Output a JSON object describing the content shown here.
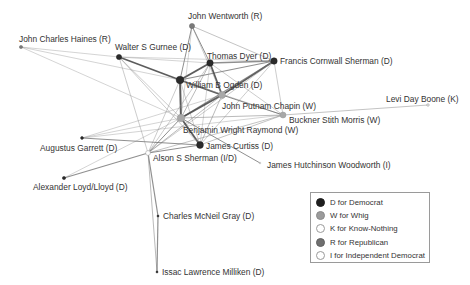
{
  "colors": {
    "D": "#2b2b2b",
    "W": "#a8a8a8",
    "K": "#ffffff",
    "R": "#7a7a7a",
    "I": "#ffffff"
  },
  "legend": {
    "items": [
      {
        "key": "D",
        "label": "D for Democrat",
        "fill": "#1e1e1e",
        "stroke": "#1e1e1e"
      },
      {
        "key": "W",
        "label": "W for Whig",
        "fill": "#9b9b9b",
        "stroke": "#8a8a8a"
      },
      {
        "key": "K",
        "label": "K for Know-Nothing",
        "fill": "#ffffff",
        "stroke": "#9a9a9a"
      },
      {
        "key": "R",
        "label": "R for Republican",
        "fill": "#6f6f6f",
        "stroke": "#606060"
      },
      {
        "key": "I",
        "label": "I for Independent Democrat",
        "fill": "#ffffff",
        "stroke": "#9a9a9a"
      }
    ]
  },
  "nodes": [
    {
      "id": "wentworth",
      "label": "John Wentworth (R)",
      "party": "R",
      "x": 192,
      "y": 26,
      "r": 2.6,
      "lx": 188,
      "ly": 19,
      "anchor": "start"
    },
    {
      "id": "haines",
      "label": "John Charles Haines (R)",
      "party": "R",
      "x": 21,
      "y": 47,
      "r": 1.6,
      "lx": 19,
      "ly": 42,
      "anchor": "start"
    },
    {
      "id": "gurnee",
      "label": "Walter S Gurnee (D)",
      "party": "D",
      "x": 119,
      "y": 57,
      "r": 2.6,
      "lx": 115,
      "ly": 50,
      "anchor": "start"
    },
    {
      "id": "dyer",
      "label": "Thomas Dyer (D)",
      "party": "D",
      "x": 210,
      "y": 63,
      "r": 3.2,
      "lx": 207,
      "ly": 59,
      "anchor": "start"
    },
    {
      "id": "fsherman",
      "label": "Francis Cornwall Sherman (D)",
      "party": "D",
      "x": 274,
      "y": 61,
      "r": 3.2,
      "lx": 280,
      "ly": 64,
      "anchor": "start"
    },
    {
      "id": "ogden",
      "label": "William B Ogden (D)",
      "party": "D",
      "x": 180,
      "y": 80,
      "r": 3.8,
      "lx": 186,
      "ly": 88,
      "anchor": "start"
    },
    {
      "id": "chapin",
      "label": "John Putnam Chapin (W)",
      "party": "W",
      "x": 222,
      "y": 95,
      "r": 3.4,
      "lx": 222,
      "ly": 109,
      "anchor": "start"
    },
    {
      "id": "boone",
      "label": "Levi Day Boone (K)",
      "party": "K",
      "x": 428,
      "y": 105,
      "r": 1.2,
      "lx": 386,
      "ly": 102,
      "anchor": "start"
    },
    {
      "id": "morris",
      "label": "Buckner Stith Morris (W)",
      "party": "W",
      "x": 283,
      "y": 115,
      "r": 3.0,
      "lx": 289,
      "ly": 123,
      "anchor": "start"
    },
    {
      "id": "raymond",
      "label": "Benjamin Wright Raymond (W)",
      "party": "W",
      "x": 181,
      "y": 118,
      "r": 3.8,
      "lx": 183,
      "ly": 133,
      "anchor": "start"
    },
    {
      "id": "garrett",
      "label": "Augustus Garrett (D)",
      "party": "D",
      "x": 82,
      "y": 138,
      "r": 1.4,
      "lx": 40,
      "ly": 151,
      "anchor": "start"
    },
    {
      "id": "curtiss",
      "label": "James Curtiss (D)",
      "party": "D",
      "x": 200,
      "y": 145,
      "r": 3.4,
      "lx": 206,
      "ly": 149,
      "anchor": "start"
    },
    {
      "id": "asherman",
      "label": "Alson S Sherman (I/D)",
      "party": "I",
      "x": 148,
      "y": 153,
      "r": 2.4,
      "lx": 153,
      "ly": 161,
      "anchor": "start"
    },
    {
      "id": "woodworth",
      "label": "James Hutchinson Woodworth (I)",
      "party": "I",
      "x": 260,
      "y": 163,
      "r": 0.8,
      "lx": 267,
      "ly": 168,
      "anchor": "start"
    },
    {
      "id": "lloyd",
      "label": "Alexander Loyd/Lloyd (D)",
      "party": "D",
      "x": 64,
      "y": 178,
      "r": 1.6,
      "lx": 33,
      "ly": 190,
      "anchor": "start"
    },
    {
      "id": "gray",
      "label": "Charles McNeil Gray (D)",
      "party": "D",
      "x": 158,
      "y": 216,
      "r": 1.0,
      "lx": 163,
      "ly": 219,
      "anchor": "start"
    },
    {
      "id": "milliken",
      "label": "Issac Lawrence Milliken (D)",
      "party": "D",
      "x": 157,
      "y": 272,
      "r": 1.0,
      "lx": 162,
      "ly": 275,
      "anchor": "start"
    }
  ],
  "edges": [
    {
      "s": "ogden",
      "t": "dyer",
      "w": 2.0
    },
    {
      "s": "ogden",
      "t": "raymond",
      "w": 2.0
    },
    {
      "s": "ogden",
      "t": "chapin",
      "w": 1.8
    },
    {
      "s": "ogden",
      "t": "fsherman",
      "w": 1.2
    },
    {
      "s": "ogden",
      "t": "gurnee",
      "w": 1.6
    },
    {
      "s": "ogden",
      "t": "wentworth",
      "w": 1.0
    },
    {
      "s": "ogden",
      "t": "morris",
      "w": 0.6
    },
    {
      "s": "ogden",
      "t": "curtiss",
      "w": 0.6
    },
    {
      "s": "ogden",
      "t": "asherman",
      "w": 0.6
    },
    {
      "s": "ogden",
      "t": "haines",
      "w": 0.5
    },
    {
      "s": "dyer",
      "t": "chapin",
      "w": 1.8
    },
    {
      "s": "dyer",
      "t": "fsherman",
      "w": 1.4
    },
    {
      "s": "dyer",
      "t": "wentworth",
      "w": 1.0
    },
    {
      "s": "dyer",
      "t": "raymond",
      "w": 0.8
    },
    {
      "s": "dyer",
      "t": "morris",
      "w": 0.6
    },
    {
      "s": "dyer",
      "t": "asherman",
      "w": 0.6
    },
    {
      "s": "dyer",
      "t": "curtiss",
      "w": 0.5
    },
    {
      "s": "dyer",
      "t": "gurnee",
      "w": 0.5
    },
    {
      "s": "wentworth",
      "t": "fsherman",
      "w": 0.7
    },
    {
      "s": "wentworth",
      "t": "chapin",
      "w": 0.6
    },
    {
      "s": "wentworth",
      "t": "raymond",
      "w": 0.5
    },
    {
      "s": "fsherman",
      "t": "chapin",
      "w": 1.6
    },
    {
      "s": "fsherman",
      "t": "raymond",
      "w": 1.2
    },
    {
      "s": "fsherman",
      "t": "morris",
      "w": 0.6
    },
    {
      "s": "fsherman",
      "t": "curtiss",
      "w": 0.6
    },
    {
      "s": "fsherman",
      "t": "asherman",
      "w": 0.6
    },
    {
      "s": "fsherman",
      "t": "gurnee",
      "w": 0.5
    },
    {
      "s": "chapin",
      "t": "raymond",
      "w": 1.8
    },
    {
      "s": "chapin",
      "t": "morris",
      "w": 1.0
    },
    {
      "s": "chapin",
      "t": "curtiss",
      "w": 0.8
    },
    {
      "s": "chapin",
      "t": "asherman",
      "w": 0.8
    },
    {
      "s": "chapin",
      "t": "garrett",
      "w": 0.5
    },
    {
      "s": "raymond",
      "t": "curtiss",
      "w": 1.8
    },
    {
      "s": "raymond",
      "t": "morris",
      "w": 0.8
    },
    {
      "s": "raymond",
      "t": "asherman",
      "w": 1.0
    },
    {
      "s": "raymond",
      "t": "woodworth",
      "w": 1.0
    },
    {
      "s": "raymond",
      "t": "gurnee",
      "w": 0.6
    },
    {
      "s": "raymond",
      "t": "haines",
      "w": 0.5
    },
    {
      "s": "raymond",
      "t": "garrett",
      "w": 0.5
    },
    {
      "s": "raymond",
      "t": "lloyd",
      "w": 0.5
    },
    {
      "s": "morris",
      "t": "boone",
      "w": 0.7
    },
    {
      "s": "morris",
      "t": "curtiss",
      "w": 0.7
    },
    {
      "s": "morris",
      "t": "asherman",
      "w": 0.7
    },
    {
      "s": "morris",
      "t": "garrett",
      "w": 0.5
    },
    {
      "s": "curtiss",
      "t": "asherman",
      "w": 1.0
    },
    {
      "s": "curtiss",
      "t": "garrett",
      "w": 1.0
    },
    {
      "s": "curtiss",
      "t": "gurnee",
      "w": 0.6
    },
    {
      "s": "asherman",
      "t": "lloyd",
      "w": 1.2
    },
    {
      "s": "asherman",
      "t": "gray",
      "w": 1.2
    },
    {
      "s": "asherman",
      "t": "milliken",
      "w": 0.8
    },
    {
      "s": "asherman",
      "t": "gurnee",
      "w": 0.6
    },
    {
      "s": "gray",
      "t": "milliken",
      "w": 1.2
    },
    {
      "s": "gurnee",
      "t": "haines",
      "w": 0.5
    }
  ]
}
